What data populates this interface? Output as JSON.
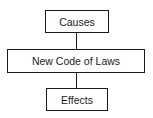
{
  "diagram": {
    "type": "vertical-flowchart",
    "nodes": [
      {
        "id": "causes",
        "label": "Causes"
      },
      {
        "id": "code",
        "label": "New Code of Laws"
      },
      {
        "id": "effects",
        "label": "Effects"
      }
    ],
    "edges": [
      {
        "from": "causes",
        "to": "code"
      },
      {
        "from": "code",
        "to": "effects"
      }
    ],
    "colors": {
      "border": "#1a1a1a",
      "text": "#222222",
      "background": "#ffffff"
    }
  }
}
